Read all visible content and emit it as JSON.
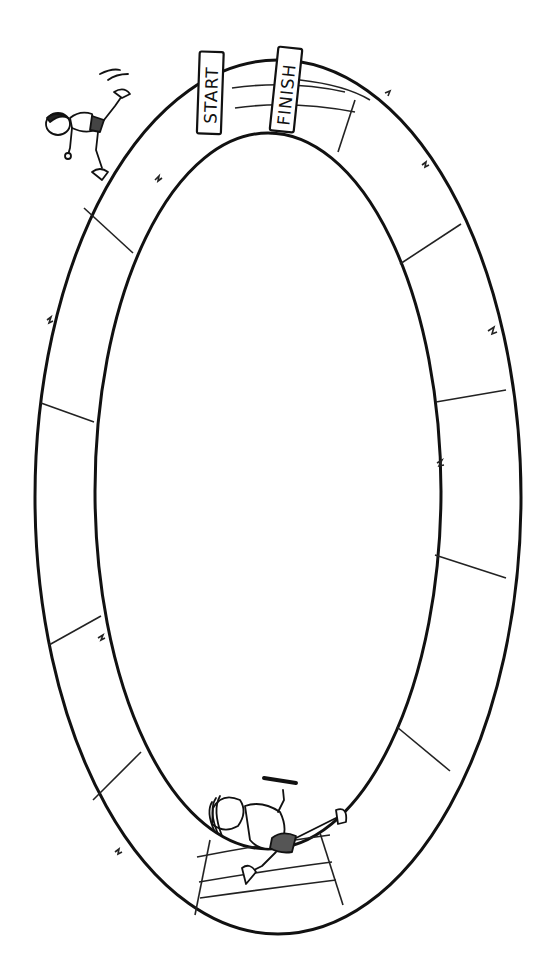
{
  "board": {
    "type": "race-track game board",
    "start_label": "START",
    "finish_label": "FINISH",
    "track_spaces": 12,
    "colors": {
      "line": "#111111",
      "background": "#ffffff"
    }
  },
  "figures": [
    {
      "name": "runner-top-left",
      "description": "boy runner stumbling near start"
    },
    {
      "name": "runner-bottom",
      "description": "girl runner holding relay baton"
    }
  ]
}
